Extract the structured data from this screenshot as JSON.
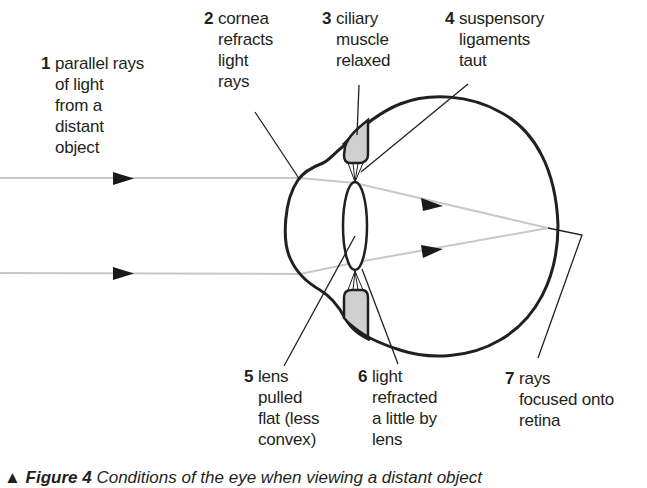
{
  "diagram": {
    "labels": [
      {
        "number": "1",
        "lines": [
          "parallel rays",
          "of light",
          "from a",
          "distant",
          "object"
        ]
      },
      {
        "number": "2",
        "lines": [
          "cornea",
          "refracts",
          "light",
          "rays"
        ]
      },
      {
        "number": "3",
        "lines": [
          "ciliary",
          "muscle",
          "relaxed"
        ]
      },
      {
        "number": "4",
        "lines": [
          "suspensory",
          "ligaments",
          "taut"
        ]
      },
      {
        "number": "5",
        "lines": [
          "lens",
          "pulled",
          "flat (less",
          "convex)"
        ]
      },
      {
        "number": "6",
        "lines": [
          "light",
          "refracted",
          "a little by",
          "lens"
        ]
      },
      {
        "number": "7",
        "lines": [
          "rays",
          "focused onto",
          "retina"
        ]
      }
    ],
    "caption": {
      "marker": "▲",
      "figure": "Figure 4",
      "text": "Conditions of the eye when viewing a distant object"
    },
    "colors": {
      "outline": "#231f20",
      "ray": "#c8c8c8",
      "muscle_fill": "#cfcfcf",
      "arrow": "#1a1a1a"
    }
  }
}
